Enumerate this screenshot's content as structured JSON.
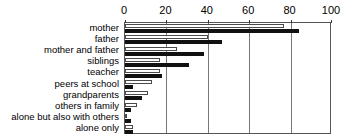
{
  "chart_data": {
    "type": "bar",
    "orientation": "horizontal",
    "title": "",
    "xlabel": "",
    "ylabel": "",
    "xlim": [
      0,
      100
    ],
    "xticks": [
      0,
      20,
      40,
      60,
      80,
      100
    ],
    "grid": true,
    "legend": "none",
    "categories": [
      "mother",
      "father",
      "mother and father",
      "siblings",
      "teacher",
      "peers at school",
      "grandparents",
      "others in family",
      "alone but also with others",
      "alone only"
    ],
    "series": [
      {
        "name": "series-1",
        "style": "outlined",
        "color": "#ffffff",
        "values": [
          77,
          40,
          25,
          17,
          17,
          13,
          11,
          6,
          1,
          4
        ]
      },
      {
        "name": "series-2",
        "style": "filled",
        "color": "#111111",
        "values": [
          84,
          47,
          38,
          31,
          18,
          4,
          8,
          3,
          3,
          4
        ]
      }
    ]
  }
}
